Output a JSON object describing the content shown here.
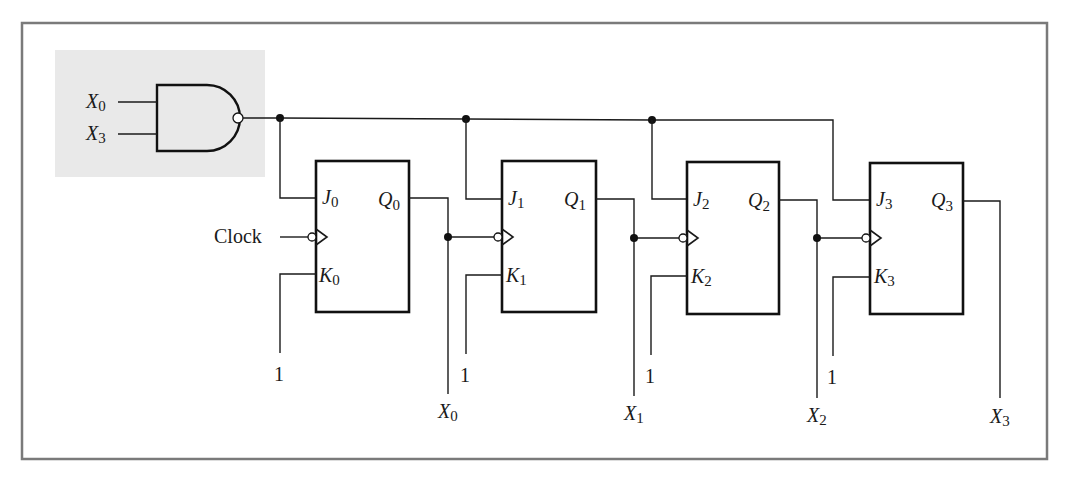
{
  "diagram": {
    "type": "circuit",
    "gate": {
      "type": "NAND",
      "inputs": [
        {
          "name": "X",
          "sub": "0"
        },
        {
          "name": "X",
          "sub": "3"
        }
      ]
    },
    "clock_label": "Clock",
    "flip_flops": [
      {
        "j": "J",
        "k": "K",
        "q": "Q",
        "sub": "0",
        "k_input": "1",
        "output": {
          "name": "X",
          "sub": "0"
        }
      },
      {
        "j": "J",
        "k": "K",
        "q": "Q",
        "sub": "1",
        "k_input": "1",
        "output": {
          "name": "X",
          "sub": "1"
        }
      },
      {
        "j": "J",
        "k": "K",
        "q": "Q",
        "sub": "2",
        "k_input": "1",
        "output": {
          "name": "X",
          "sub": "2"
        }
      },
      {
        "j": "J",
        "k": "K",
        "q": "Q",
        "sub": "3",
        "k_input": "1",
        "output": {
          "name": "X",
          "sub": "3"
        }
      }
    ],
    "colors": {
      "frame": "#7a7a7a",
      "shade": "#e9e9e9",
      "ink": "#111111"
    }
  }
}
